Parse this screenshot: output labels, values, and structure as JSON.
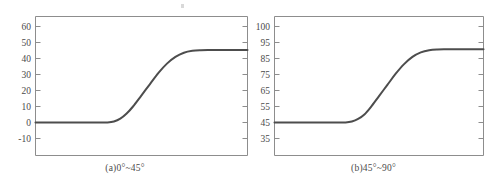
{
  "figure": {
    "panels": [
      {
        "id": "panel-a",
        "caption": "(a)0°~45°",
        "chart_data": {
          "type": "line",
          "title": "(a)0°~45°",
          "xlabel": "",
          "ylabel": "",
          "grid": false,
          "legend": null,
          "yticks": [
            60,
            50,
            40,
            30,
            20,
            10,
            0,
            -10
          ],
          "ytick_labels": [
            "60",
            "50",
            "40",
            "30",
            "20",
            "10",
            "0",
            "-10"
          ],
          "ylim": [
            -20,
            70
          ],
          "xlim": [
            0,
            100
          ],
          "xticks": [],
          "xtick_labels": [],
          "series": [
            {
              "name": "angle-response",
              "x": [
                0,
                5,
                10,
                15,
                20,
                25,
                30,
                34,
                37,
                40,
                43,
                46,
                50,
                54,
                58,
                62,
                66,
                70,
                74,
                78,
                82,
                86,
                90,
                95,
                100
              ],
              "y": [
                0,
                0,
                0,
                0,
                0,
                0,
                0,
                0,
                0.6,
                2.4,
                5.6,
                10.0,
                17.0,
                24.0,
                31.0,
                36.8,
                41.0,
                43.6,
                44.8,
                45.2,
                45.3,
                45.3,
                45.3,
                45.3,
                45.3
              ]
            }
          ]
        }
      },
      {
        "id": "panel-b",
        "caption": "(b)45°~90°",
        "chart_data": {
          "type": "line",
          "title": "(b)45°~90°",
          "xlabel": "",
          "ylabel": "",
          "grid": false,
          "legend": null,
          "yticks": [
            100,
            95,
            85,
            75,
            65,
            55,
            45,
            35
          ],
          "ytick_labels": [
            "100",
            "95",
            "85",
            "75",
            "65",
            "55",
            "45",
            "35"
          ],
          "ylim": [
            25,
            105
          ],
          "xlim": [
            0,
            100
          ],
          "xticks": [],
          "xtick_labels": [],
          "series": [
            {
              "name": "angle-response",
              "x": [
                0,
                5,
                10,
                15,
                20,
                25,
                30,
                34,
                37,
                40,
                43,
                46,
                50,
                54,
                58,
                62,
                66,
                70,
                74,
                78,
                82,
                86,
                90,
                95,
                100
              ],
              "y": [
                45,
                45,
                45,
                45,
                45,
                45,
                45,
                45,
                45.6,
                47.2,
                50.0,
                54.5,
                61.5,
                68.5,
                75.5,
                81.5,
                86.0,
                88.8,
                90.2,
                90.7,
                90.8,
                90.8,
                90.8,
                90.8,
                90.8
              ]
            }
          ]
        }
      }
    ]
  }
}
